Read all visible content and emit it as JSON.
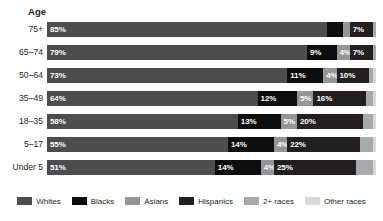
{
  "chart_data": {
    "type": "bar",
    "subtype": "stacked-horizontal-100",
    "title": "",
    "xlabel": "",
    "ylabel": "Age",
    "axis_title": "Age",
    "grid": false,
    "xlim": [
      0,
      100
    ],
    "legend_position": "bottom",
    "categories": [
      "75+",
      "65–74",
      "50–64",
      "35–49",
      "18–35",
      "5–17",
      "Under 5"
    ],
    "series": [
      {
        "name": "Whites",
        "color": "#4d4d4f",
        "values": [
          85,
          79,
          73,
          64,
          58,
          55,
          51
        ]
      },
      {
        "name": "Blacks",
        "color": "#0d0d0d",
        "values": [
          5,
          9,
          11,
          12,
          13,
          14,
          14
        ]
      },
      {
        "name": "Asians",
        "color": "#939598",
        "values": [
          2,
          4,
          4,
          5,
          5,
          4,
          4
        ]
      },
      {
        "name": "Hispanics",
        "color": "#231f20",
        "values": [
          7,
          7,
          10,
          16,
          20,
          22,
          25
        ]
      },
      {
        "name": "2+ races",
        "color": "#a7a9ac",
        "values": [
          1,
          1,
          1,
          2,
          3,
          4,
          5
        ]
      },
      {
        "name": "Other races",
        "color": "#d8d9da",
        "values": [
          5,
          2,
          1,
          1,
          1,
          1,
          1
        ]
      }
    ],
    "bar_labels": [
      [
        {
          "series": "Whites",
          "text": "85%",
          "show": true
        },
        {
          "series": "Blacks",
          "text": "5%",
          "show": false
        },
        {
          "series": "Asians",
          "text": "2%",
          "show": false
        },
        {
          "series": "Hispanics",
          "text": "7%",
          "show": true
        },
        {
          "series": "2+ races",
          "text": "1%",
          "show": false
        },
        {
          "series": "Other races",
          "text": "5%",
          "show": true
        }
      ],
      [
        {
          "series": "Whites",
          "text": "79%",
          "show": true
        },
        {
          "series": "Blacks",
          "text": "9%",
          "show": true
        },
        {
          "series": "Asians",
          "text": "4%",
          "show": true
        },
        {
          "series": "Hispanics",
          "text": "7%",
          "show": true
        },
        {
          "series": "2+ races",
          "text": "1%",
          "show": false
        },
        {
          "series": "Other races",
          "text": "2%",
          "show": false
        }
      ],
      [
        {
          "series": "Whites",
          "text": "73%",
          "show": true
        },
        {
          "series": "Blacks",
          "text": "11%",
          "show": true
        },
        {
          "series": "Asians",
          "text": "4%",
          "show": true
        },
        {
          "series": "Hispanics",
          "text": "10%",
          "show": true
        },
        {
          "series": "2+ races",
          "text": "1%",
          "show": false
        },
        {
          "series": "Other races",
          "text": "1%",
          "show": false
        }
      ],
      [
        {
          "series": "Whites",
          "text": "64%",
          "show": true
        },
        {
          "series": "Blacks",
          "text": "12%",
          "show": true
        },
        {
          "series": "Asians",
          "text": "5%",
          "show": true
        },
        {
          "series": "Hispanics",
          "text": "16%",
          "show": true
        },
        {
          "series": "2+ races",
          "text": "2%",
          "show": false
        },
        {
          "series": "Other races",
          "text": "1%",
          "show": false
        }
      ],
      [
        {
          "series": "Whites",
          "text": "58%",
          "show": true
        },
        {
          "series": "Blacks",
          "text": "13%",
          "show": true
        },
        {
          "series": "Asians",
          "text": "5%",
          "show": true
        },
        {
          "series": "Hispanics",
          "text": "20%",
          "show": true
        },
        {
          "series": "2+ races",
          "text": "3%",
          "show": false
        },
        {
          "series": "Other races",
          "text": "1%",
          "show": false
        }
      ],
      [
        {
          "series": "Whites",
          "text": "55%",
          "show": true
        },
        {
          "series": "Blacks",
          "text": "14%",
          "show": true
        },
        {
          "series": "Asians",
          "text": "4%",
          "show": true
        },
        {
          "series": "Hispanics",
          "text": "22%",
          "show": true
        },
        {
          "series": "2+ races",
          "text": "4%",
          "show": false
        },
        {
          "series": "Other races",
          "text": "1%",
          "show": false
        }
      ],
      [
        {
          "series": "Whites",
          "text": "51%",
          "show": true
        },
        {
          "series": "Blacks",
          "text": "14%",
          "show": true
        },
        {
          "series": "Asians",
          "text": "4%",
          "show": true
        },
        {
          "series": "Hispanics",
          "text": "25%",
          "show": true
        },
        {
          "series": "2+ races",
          "text": "5%",
          "show": false
        },
        {
          "series": "Other races",
          "text": "1%",
          "show": false
        }
      ]
    ],
    "legend": [
      {
        "label": "Whites",
        "color": "#4d4d4f"
      },
      {
        "label": "Blacks",
        "color": "#0d0d0d"
      },
      {
        "label": "Asians",
        "color": "#939598"
      },
      {
        "label": "Hispanics",
        "color": "#231f20"
      },
      {
        "label": "2+ races",
        "color": "#a7a9ac"
      },
      {
        "label": "Other races",
        "color": "#d8d9da"
      }
    ]
  }
}
